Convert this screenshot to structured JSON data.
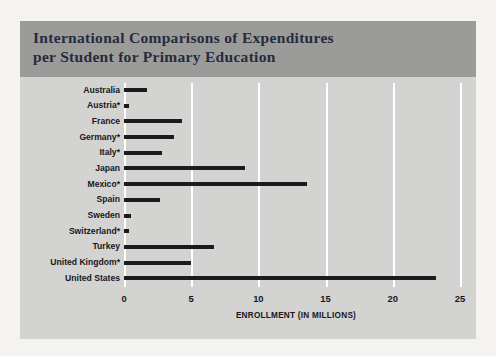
{
  "figure": {
    "background_color": "#f4f3f1",
    "panel_color": "#d3d3d1",
    "title_band_color": "#9b9b99",
    "title_color": "#262b3d",
    "bar_color": "#1b1b1b",
    "gridline_color": "#ffffff",
    "title": "International Comparisons of Expenditures\nper Student for Primary Education"
  },
  "chart_data": {
    "type": "bar",
    "orientation": "horizontal",
    "title": "International Comparisons of Expenditures per Student for Primary Education",
    "xlabel": "ENROLLMENT (IN MILLIONS)",
    "ylabel": "",
    "xlim": [
      0,
      25.6
    ],
    "xticks": [
      0,
      5,
      10,
      15,
      20,
      25
    ],
    "xtick_labels": [
      "0",
      "5",
      "10",
      "15",
      "20",
      "25"
    ],
    "grid": "vertical",
    "legend": "none",
    "footnote_marker": "*",
    "categories": [
      "Australia",
      "Austria*",
      "France",
      "Germany*",
      "Italy*",
      "Japan",
      "Mexico*",
      "Spain",
      "Sweden",
      "Switzerland*",
      "Turkey",
      "United Kingdom*",
      "United States"
    ],
    "values": [
      1.7,
      0.35,
      4.3,
      3.7,
      2.8,
      9.0,
      13.6,
      2.7,
      0.55,
      0.4,
      6.7,
      5.0,
      23.2
    ]
  }
}
